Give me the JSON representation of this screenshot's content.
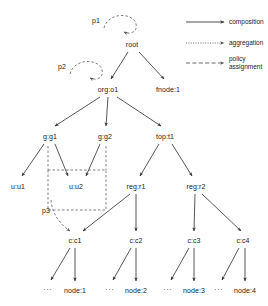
{
  "diagram": {
    "title": "",
    "nodes": [
      {
        "id": "root",
        "label": "root",
        "x": 132,
        "y": 44
      },
      {
        "id": "org_o1",
        "label": "org:o1",
        "x": 108,
        "y": 89
      },
      {
        "id": "fnode_1",
        "label": "fnode:1",
        "x": 168,
        "y": 89
      },
      {
        "id": "g_g1",
        "label": "g:g1",
        "x": 50,
        "y": 136
      },
      {
        "id": "g_g2",
        "label": "g:g2",
        "x": 105,
        "y": 136
      },
      {
        "id": "top_t1",
        "label": "top:t1",
        "x": 165,
        "y": 136
      },
      {
        "id": "u_u1",
        "label": "u:u1",
        "x": 18,
        "y": 186
      },
      {
        "id": "u_u2",
        "label": "u:u2",
        "x": 76,
        "y": 186
      },
      {
        "id": "reg_r1",
        "label": "reg:r1",
        "x": 136,
        "y": 186
      },
      {
        "id": "reg_r2",
        "label": "reg:r2",
        "x": 196,
        "y": 186
      },
      {
        "id": "c_c1",
        "label": "c:c1",
        "x": 75,
        "y": 240
      },
      {
        "id": "c_c2",
        "label": "c:c2",
        "x": 136,
        "y": 240
      },
      {
        "id": "c_c3",
        "label": "c:c3",
        "x": 194,
        "y": 240
      },
      {
        "id": "c_c4",
        "label": "c:c4",
        "x": 243,
        "y": 240
      },
      {
        "id": "node_1",
        "label": "node:1",
        "x": 75,
        "y": 290
      },
      {
        "id": "node_2",
        "label": "node:2",
        "x": 136,
        "y": 290
      },
      {
        "id": "node_3",
        "label": "node:3",
        "x": 194,
        "y": 290
      },
      {
        "id": "node_4",
        "label": "node:4",
        "x": 245,
        "y": 290
      }
    ],
    "ellipses": [
      {
        "id": "ellipsis-1",
        "label": "...",
        "x": 48,
        "y": 288
      },
      {
        "id": "ellipsis-2",
        "label": "...",
        "x": 110,
        "y": 288
      },
      {
        "id": "ellipsis-3",
        "label": "...",
        "x": 168,
        "y": 288
      },
      {
        "id": "ellipsis-4",
        "label": "...",
        "x": 219,
        "y": 288
      }
    ],
    "policies": [
      {
        "id": "p1",
        "label": "p1",
        "x": 96,
        "y": 20,
        "target": "root"
      },
      {
        "id": "p2",
        "label": "p2",
        "x": 62,
        "y": 66,
        "target": "org:o1"
      },
      {
        "id": "p3",
        "label": "p3",
        "x": 46,
        "y": 210,
        "target": "c:c1"
      }
    ],
    "composition_edges": [
      {
        "from": "root",
        "to": "org:o1"
      },
      {
        "from": "root",
        "to": "fnode:1"
      },
      {
        "from": "org:o1",
        "to": "g:g1"
      },
      {
        "from": "org:o1",
        "to": "g:g2"
      },
      {
        "from": "org:o1",
        "to": "top:t1"
      },
      {
        "from": "g:g1",
        "to": "u:u1"
      },
      {
        "from": "g:g1",
        "to": "u:u2"
      },
      {
        "from": "g:g2",
        "to": "u:u2"
      },
      {
        "from": "top:t1",
        "to": "reg:r1"
      },
      {
        "from": "top:t1",
        "to": "reg:r2"
      },
      {
        "from": "reg:r1",
        "to": "c:c1"
      },
      {
        "from": "reg:r1",
        "to": "c:c2"
      },
      {
        "from": "reg:r2",
        "to": "c:c3"
      },
      {
        "from": "reg:r2",
        "to": "c:c4"
      },
      {
        "from": "c:c1",
        "to": "node:1"
      },
      {
        "from": "c:c2",
        "to": "node:2"
      },
      {
        "from": "c:c3",
        "to": "node:3"
      },
      {
        "from": "c:c4",
        "to": "node:4"
      }
    ],
    "aggregation_edges": [
      {
        "from": "c:c1",
        "to": "..."
      },
      {
        "from": "c:c2",
        "to": "..."
      },
      {
        "from": "c:c3",
        "to": "..."
      },
      {
        "from": "c:c4",
        "to": "..."
      }
    ],
    "group_box": {
      "id": "user-group-box",
      "label": "",
      "x": 48,
      "y": 170,
      "w": 58,
      "h": 40
    }
  },
  "legend": {
    "items": [
      {
        "id": "composition",
        "label": "composition",
        "style": "solid"
      },
      {
        "id": "aggregation",
        "label": "aggregation",
        "style": "dotted"
      },
      {
        "id": "policy-assignment",
        "label": "policy\nassignment",
        "label_line1": "policy",
        "label_line2": "assignment",
        "style": "dashed"
      }
    ]
  },
  "colors": {
    "stroke": "#3a3a3a",
    "text": "#1a1a1a",
    "background": "#ffffff",
    "dash": "#6a6a6a"
  }
}
